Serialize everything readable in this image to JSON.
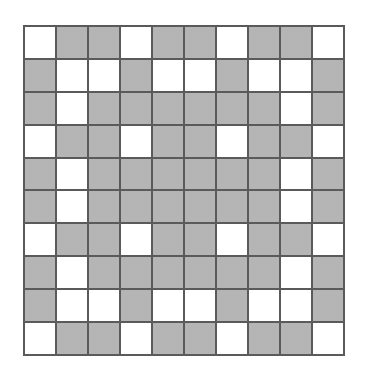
{
  "figure": {
    "type": "grid-pattern",
    "rows": 10,
    "cols": 10,
    "legend": {
      "W": "white cell",
      "G": "gray cell"
    },
    "colors": {
      "white": "#ffffff",
      "gray": "#c6c6c6",
      "border": "#5a5a5a"
    },
    "grid": [
      [
        "W",
        "G",
        "G",
        "W",
        "G",
        "G",
        "W",
        "G",
        "G",
        "W"
      ],
      [
        "G",
        "W",
        "W",
        "G",
        "W",
        "W",
        "G",
        "W",
        "W",
        "G"
      ],
      [
        "G",
        "W",
        "G",
        "G",
        "G",
        "G",
        "G",
        "G",
        "W",
        "G"
      ],
      [
        "W",
        "G",
        "G",
        "W",
        "G",
        "G",
        "W",
        "G",
        "G",
        "W"
      ],
      [
        "G",
        "W",
        "G",
        "G",
        "G",
        "G",
        "G",
        "G",
        "W",
        "G"
      ],
      [
        "G",
        "W",
        "G",
        "G",
        "G",
        "G",
        "G",
        "G",
        "W",
        "G"
      ],
      [
        "W",
        "G",
        "G",
        "W",
        "G",
        "G",
        "W",
        "G",
        "G",
        "W"
      ],
      [
        "G",
        "W",
        "G",
        "G",
        "G",
        "G",
        "G",
        "G",
        "W",
        "G"
      ],
      [
        "G",
        "W",
        "W",
        "G",
        "W",
        "W",
        "G",
        "W",
        "W",
        "G"
      ],
      [
        "W",
        "G",
        "G",
        "W",
        "G",
        "G",
        "W",
        "G",
        "G",
        "W"
      ]
    ]
  }
}
